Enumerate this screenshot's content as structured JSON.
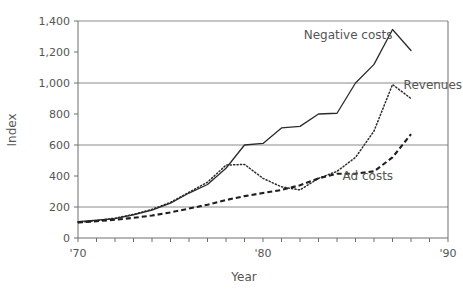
{
  "chart_data": {
    "type": "line",
    "title": "",
    "xlabel": "Year",
    "ylabel": "Index",
    "xlim": [
      1970,
      1990
    ],
    "ylim": [
      0,
      1400
    ],
    "grid": "horizontal gridlines at 200, 600, 1000, 1400",
    "legend": "inline series labels placed next to each curve",
    "y_ticks": [
      0,
      200,
      400,
      600,
      800,
      1000,
      1200,
      1400
    ],
    "y_tick_labels": [
      "0",
      "200",
      "400",
      "600",
      "800",
      "1,000",
      "1,200",
      "1,400"
    ],
    "y_gridline_values": [
      200,
      600,
      1000,
      1400
    ],
    "x_ticks": [
      1970,
      1971,
      1972,
      1973,
      1974,
      1975,
      1976,
      1977,
      1978,
      1979,
      1980,
      1981,
      1982,
      1983,
      1984,
      1985,
      1986,
      1987,
      1988,
      1989,
      1990
    ],
    "x_tick_labels": [
      "'70",
      "",
      "",
      "",
      "",
      "",
      "",
      "",
      "",
      "",
      "'80",
      "",
      "",
      "",
      "",
      "",
      "",
      "",
      "",
      "",
      "'90"
    ],
    "x_labeled_ticks": [
      "'70",
      "'80",
      "'90"
    ],
    "series": [
      {
        "name": "Negative costs",
        "style": "solid",
        "label_x": 1982.2,
        "label_y": 1285,
        "x": [
          1970,
          1971,
          1972,
          1973,
          1974,
          1975,
          1976,
          1977,
          1978,
          1979,
          1980,
          1981,
          1982,
          1983,
          1984,
          1985,
          1986,
          1987,
          1988
        ],
        "values": [
          105,
          115,
          125,
          150,
          180,
          225,
          290,
          345,
          450,
          600,
          610,
          710,
          720,
          800,
          805,
          1000,
          1120,
          1345,
          1210
        ]
      },
      {
        "name": "Revenues",
        "style": "dotted",
        "label_x": 1987.6,
        "label_y": 960,
        "x": [
          1970,
          1971,
          1972,
          1973,
          1974,
          1975,
          1976,
          1977,
          1978,
          1979,
          1980,
          1981,
          1982,
          1983,
          1984,
          1985,
          1986,
          1987,
          1988
        ],
        "values": [
          100,
          112,
          128,
          152,
          185,
          230,
          295,
          360,
          470,
          475,
          385,
          330,
          310,
          385,
          430,
          520,
          690,
          990,
          900
        ]
      },
      {
        "name": "Ad costs",
        "style": "dashed",
        "label_x": 1984.3,
        "label_y": 375,
        "x": [
          1970,
          1971,
          1972,
          1973,
          1974,
          1975,
          1976,
          1977,
          1978,
          1979,
          1980,
          1981,
          1982,
          1983,
          1984,
          1985,
          1986,
          1987,
          1988
        ],
        "values": [
          100,
          108,
          118,
          130,
          145,
          165,
          190,
          215,
          245,
          270,
          290,
          310,
          340,
          385,
          415,
          415,
          430,
          520,
          670
        ]
      }
    ]
  },
  "colors": {
    "axis": "#6e6e6e",
    "grid": "#8a8a8a",
    "text": "#555555",
    "line": "#2b2b2b",
    "background": "#ffffff"
  }
}
